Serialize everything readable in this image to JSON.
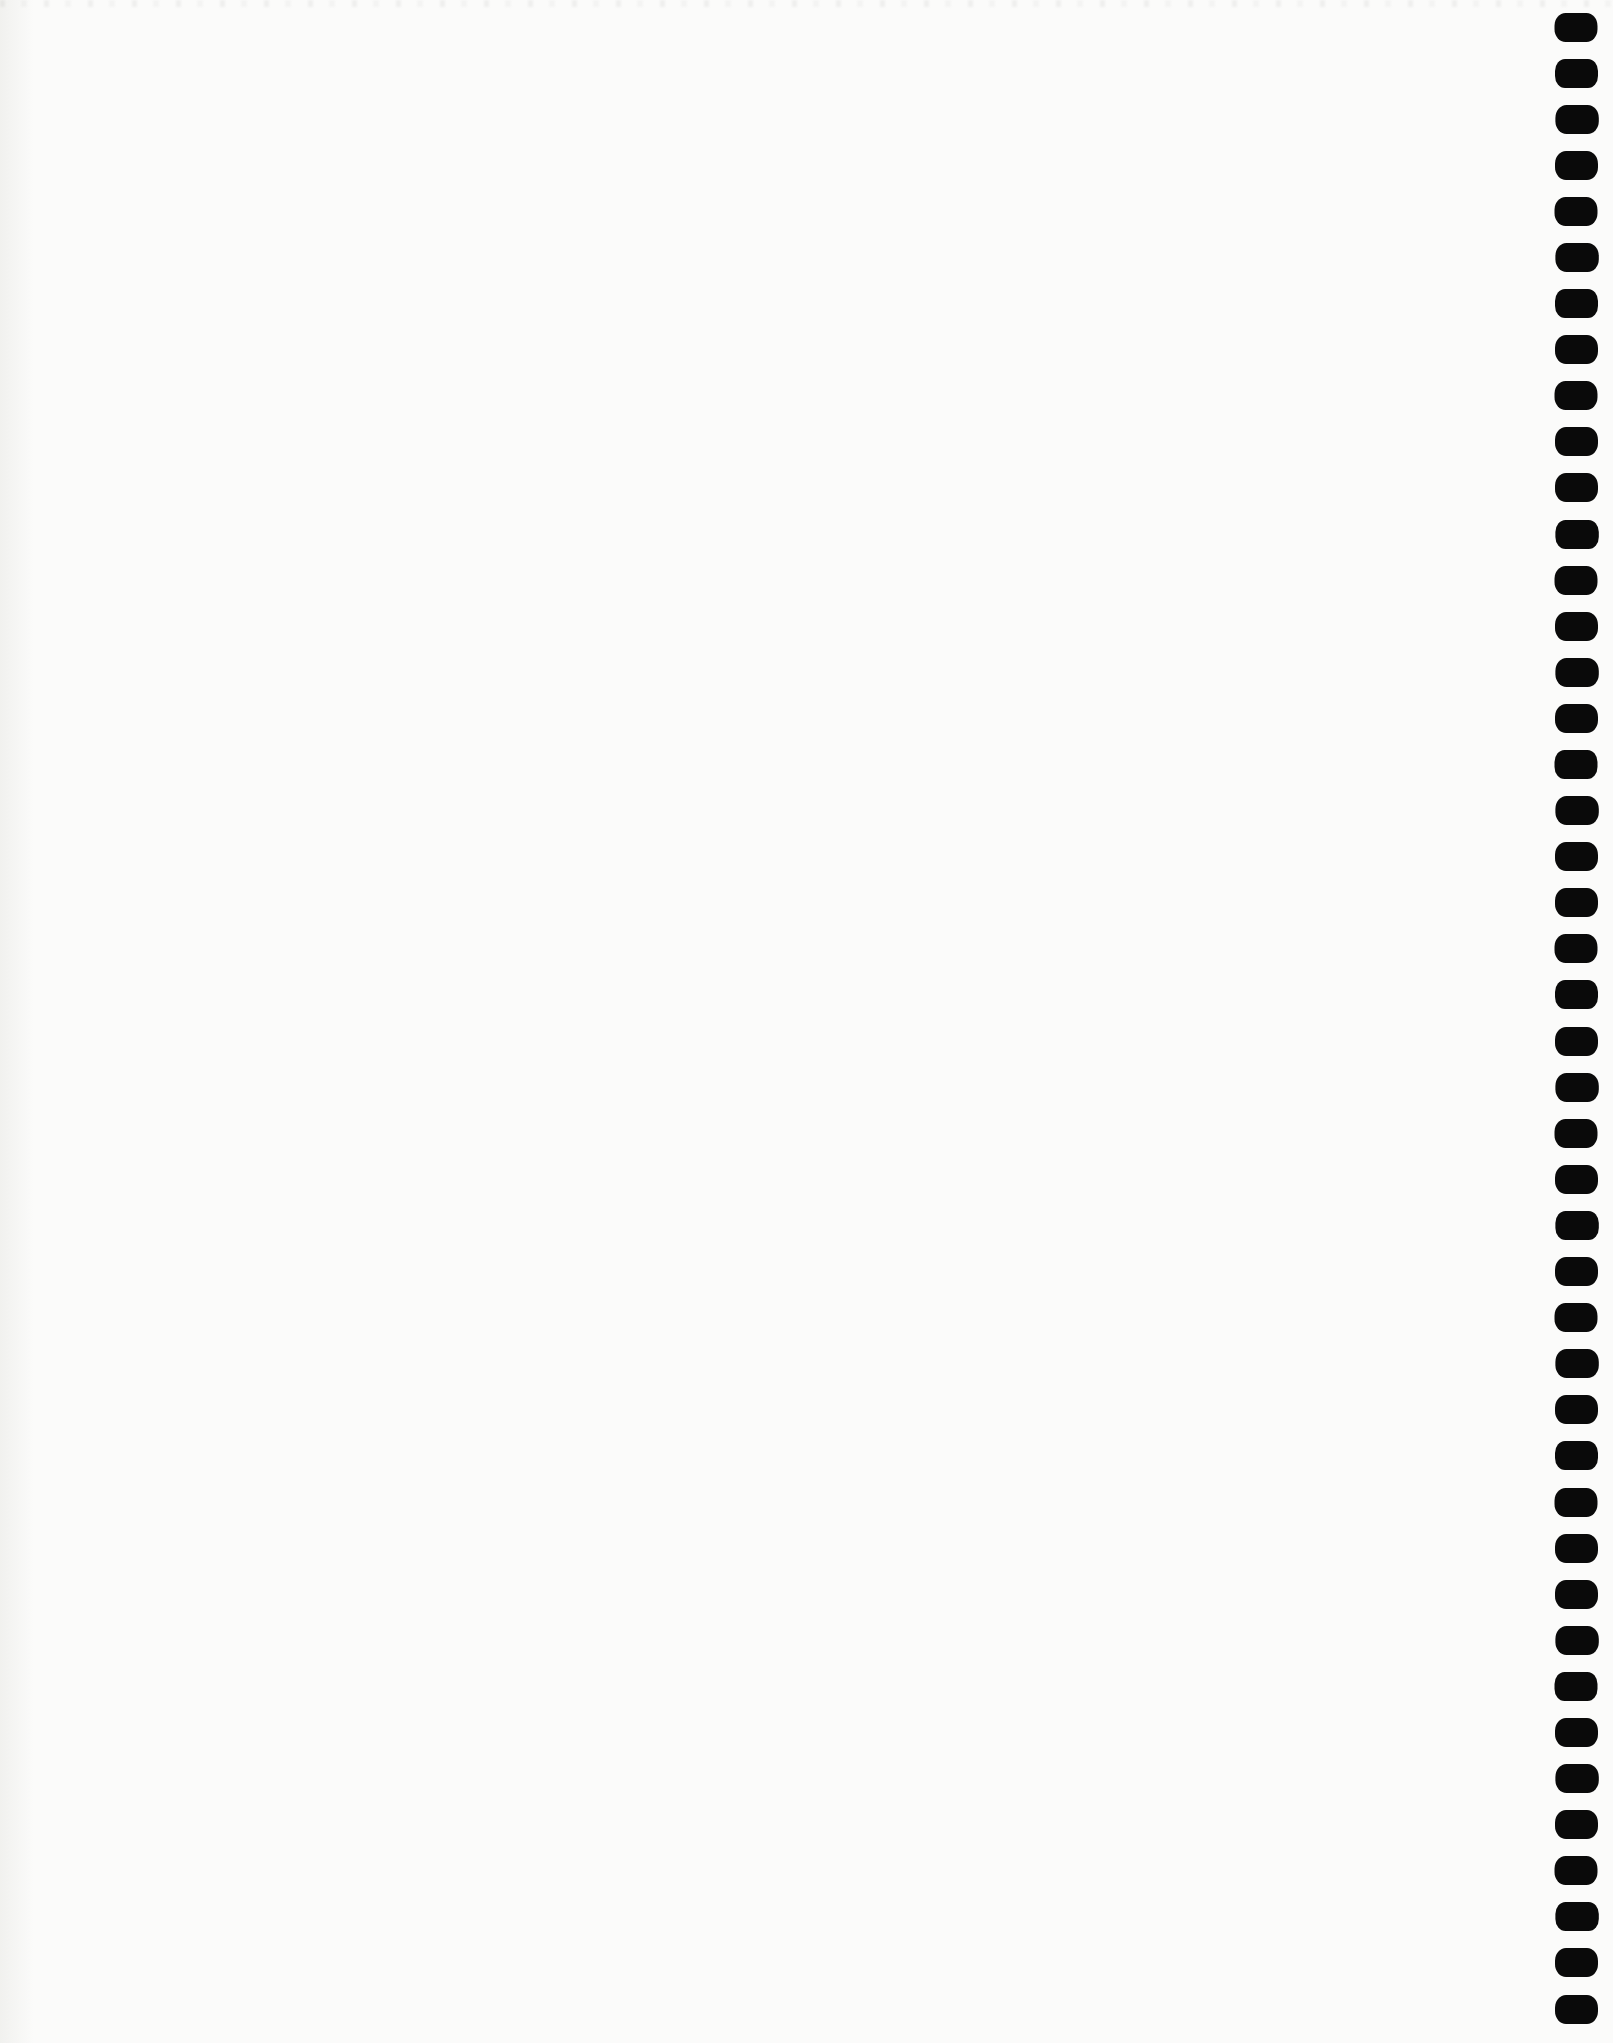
{
  "page": {
    "content_text": ""
  },
  "colors": {
    "paper": "#fbfbfa",
    "hole": "#0a0a0a"
  },
  "binding": {
    "side": "right",
    "hole_count": 44
  }
}
